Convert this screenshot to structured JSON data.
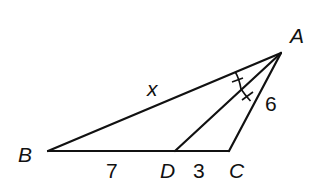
{
  "diagram": {
    "type": "triangle-angle-bisector",
    "vertices": {
      "A": {
        "label": "A",
        "x": 281,
        "y": 53
      },
      "B": {
        "label": "B",
        "x": 48,
        "y": 151
      },
      "C": {
        "label": "C",
        "x": 229,
        "y": 151
      },
      "D": {
        "label": "D",
        "x": 175,
        "y": 151
      }
    },
    "labels": {
      "A": "A",
      "B": "B",
      "C": "C",
      "D": "D",
      "AB": "x",
      "AC": "6",
      "BD": "7",
      "DC": "3"
    },
    "segments": [
      "AB",
      "BC",
      "CA",
      "AD"
    ],
    "markings": "angle BAD congruent to angle DAC (single tick arcs)",
    "line_color": "#111111"
  }
}
